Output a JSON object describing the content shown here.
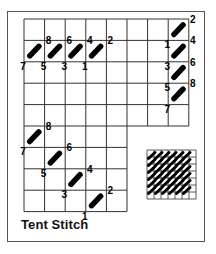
{
  "caption": "Tent Stitch",
  "colors": {
    "line": "#333333",
    "stitch": "#000000",
    "background": "#ffffff"
  },
  "grid": {
    "x0": 24,
    "y0": 19,
    "cell_w": 20.6,
    "cell_h": 21.4,
    "top_block": {
      "cols": 8,
      "rows": 5
    },
    "bottom_block": {
      "cols": 5,
      "rows": 4
    }
  },
  "sequences": [
    {
      "name": "horizontal-row",
      "stitches": [
        {
          "from": "1",
          "to": "2",
          "col": 3,
          "row": 1
        },
        {
          "from": "3",
          "to": "4",
          "col": 2,
          "row": 1
        },
        {
          "from": "5",
          "to": "6",
          "col": 1,
          "row": 1
        },
        {
          "from": "7",
          "to": "8",
          "col": 0,
          "row": 1
        }
      ]
    },
    {
      "name": "vertical-column",
      "stitches": [
        {
          "from": "1",
          "to": "2",
          "col": 7,
          "row": 0
        },
        {
          "from": "3",
          "to": "4",
          "col": 7,
          "row": 1
        },
        {
          "from": "5",
          "to": "6",
          "col": 7,
          "row": 2
        },
        {
          "from": "7",
          "to": "8",
          "col": 7,
          "row": 3
        }
      ]
    },
    {
      "name": "diagonal",
      "stitches": [
        {
          "from": "1",
          "to": "2",
          "col": 3,
          "row": 8
        },
        {
          "from": "3",
          "to": "4",
          "col": 2,
          "row": 7
        },
        {
          "from": "5",
          "to": "6",
          "col": 1,
          "row": 6
        },
        {
          "from": "7",
          "to": "8",
          "col": 0,
          "row": 5
        }
      ]
    }
  ],
  "swatch": {
    "x": 147,
    "y": 150,
    "size": 49,
    "cells": 7
  }
}
